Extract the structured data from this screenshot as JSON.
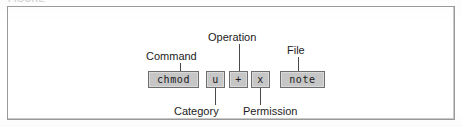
{
  "figure": {
    "top_caption_fragment": "FIGURE",
    "command_line": "chmod u+x note"
  },
  "tokens": [
    {
      "id": "command",
      "text": "chmod",
      "label": "Command",
      "label_position": "above"
    },
    {
      "id": "category",
      "text": "u",
      "label": "Category",
      "label_position": "below"
    },
    {
      "id": "operation",
      "text": "+",
      "label": "Operation",
      "label_position": "above"
    },
    {
      "id": "permission",
      "text": "x",
      "label": "Permission",
      "label_position": "below"
    },
    {
      "id": "file",
      "text": "note",
      "label": "File",
      "label_position": "above"
    }
  ],
  "colors": {
    "token_fill": "#c6c6c6",
    "token_border": "#6d6d6d",
    "frame_border": "#9a9a9a",
    "text": "#1c1c1c",
    "leader_line": "#4a4a4a",
    "page_background": "#ffffff"
  }
}
